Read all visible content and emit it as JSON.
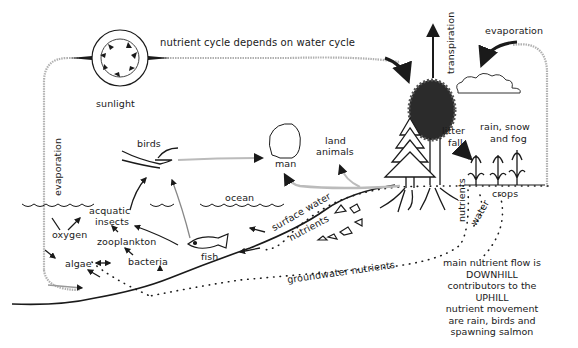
{
  "diagram": {
    "title": "nutrient cycle depends on water cycle",
    "labels": {
      "sunlight": "sunlight",
      "evaporation_left": "evaporation",
      "evaporation_right": "evaporation",
      "transpiration": "transpiration",
      "birds": "birds",
      "man": "man",
      "land_animals_1": "land",
      "land_animals_2": "animals",
      "litter_fall_1": "litter",
      "litter_fall_2": "fall",
      "rain_1": "rain, snow",
      "rain_2": "and fog",
      "ocean": "ocean",
      "acquatic_insects_1": "acquatic",
      "acquatic_insects_2": "insects",
      "oxygen": "oxygen",
      "zooplankton": "zooplankton",
      "algae": "algae",
      "bacteria": "bacteria",
      "fish": "fish",
      "surface_water": "surface water",
      "nutrients_surface": "nutrients",
      "groundwater_nutrients": "groundwater nutrients",
      "nutrients_vertical": "nutrients",
      "water_vertical": "water",
      "crops": "crops"
    },
    "note": {
      "lines": [
        "main nutrient flow is",
        "DOWNHILL",
        "contributors to the",
        "UPHILL",
        "nutrient movement",
        "are rain, birds and",
        "spawning salmon"
      ]
    },
    "colors": {
      "ink": "#1a1a1a",
      "faint_line": "#b5b5b5",
      "background": "#ffffff"
    }
  }
}
